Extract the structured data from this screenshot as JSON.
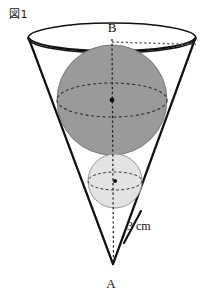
{
  "figure": {
    "caption": "図1",
    "caption_icon": "figure-marker",
    "background_color": "#ffffff",
    "stroke_color": "#111111"
  },
  "labels": {
    "apex": "A",
    "top_center": "B",
    "measurement": "3 cm"
  },
  "shapes": {
    "cone": {
      "name": "cone",
      "apex_x": 113,
      "apex_y": 264,
      "rim_center_x": 112,
      "rim_center_y": 38,
      "rim_radius_x": 84,
      "rim_radius_y": 15,
      "fill": "none",
      "stroke": "#111111",
      "stroke_width": 2.1
    },
    "large_sphere": {
      "name": "large-inscribed-sphere",
      "center_x": 112,
      "center_y": 100,
      "radius": 55,
      "fill": "#9a9a9a",
      "stroke": "#6f6f6f",
      "equator_radius_y": 17
    },
    "small_sphere": {
      "name": "small-inscribed-sphere",
      "center_x": 115,
      "center_y": 181,
      "radius": 27,
      "fill": "#e3e3e3",
      "stroke": "#9a9a9a",
      "equator_radius_y": 9
    }
  },
  "guides": {
    "axis": {
      "name": "vertical-axis",
      "from_x": 112,
      "from_y": 38,
      "to_x": 113,
      "to_y": 262,
      "style": "dotted"
    },
    "radius_line": {
      "name": "rim-radius-line",
      "from_x": 112,
      "from_y": 41,
      "to_x": 195,
      "to_y": 44,
      "style": "dotted"
    },
    "slant_tick": {
      "name": "measurement-leader-line",
      "from_x": 140,
      "from_y": 212,
      "to_x": 124,
      "to_y": 243
    }
  }
}
